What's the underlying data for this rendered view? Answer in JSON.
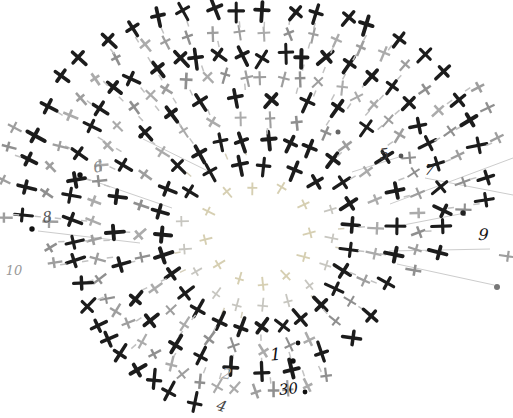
{
  "canvas": {
    "width": 513,
    "height": 418,
    "background": "#ffffff"
  },
  "diagram": {
    "kind": "crochet-single-crochet-chart",
    "center": {
      "x": 258,
      "y": 236
    },
    "radius_modulation": [
      1.0,
      1.1,
      0.98,
      1.12,
      1.02,
      0.98,
      0.97,
      0.98
    ],
    "colors": {
      "black_stitch": "#1c1c1c",
      "gray_stitch_shades": [
        "#8f8f8f",
        "#9e9e9e",
        "#ababab"
      ],
      "faint_tan": "#d6cfb2",
      "faint_gray": "#c7c6c0",
      "dash": "#c2c2c2",
      "dash_inner_tan": "#d5cfbb",
      "leader_line": "#cccccc"
    },
    "rounds": [
      {
        "name": "round-a",
        "r": 50,
        "spokes": 12,
        "offset": 95,
        "color": "tan",
        "arcs": [
          [
            0,
            360
          ]
        ]
      },
      {
        "name": "round-b",
        "r": 72,
        "spokes": 17,
        "offset": 20,
        "color": "mixed",
        "arcs": [
          [
            0,
            360
          ]
        ]
      },
      {
        "name": "round-c",
        "r": 94,
        "spokes": 27,
        "offset": 5,
        "color": "black",
        "arcs": [
          [
            0,
            360
          ]
        ]
      },
      {
        "name": "round-d",
        "r": 116,
        "spokes": 27,
        "offset": 5,
        "color": "gray",
        "arcs": [
          [
            0,
            360
          ]
        ]
      },
      {
        "name": "round-e",
        "r": 138,
        "spokes": 27,
        "offset": 5,
        "color": "black",
        "arcs": [
          [
            0,
            360
          ]
        ]
      },
      {
        "name": "round-f",
        "r": 160,
        "spokes": 54,
        "offset": 8.3,
        "color": "gray",
        "arcs": [
          [
            345,
            660
          ]
        ],
        "pairTilt": 0.35
      },
      {
        "name": "round-g",
        "r": 182,
        "spokes": 54,
        "offset": 8.3,
        "color": "black",
        "arcs": [
          [
            350,
            613
          ]
        ],
        "pairTilt": 0.25
      },
      {
        "name": "round-h",
        "r": 204,
        "spokes": 54,
        "offset": 8.3,
        "color": "gray",
        "arcs": [
          [
            2,
            194
          ]
        ]
      },
      {
        "name": "round-i",
        "r": 226,
        "spokes": 54,
        "offset": 8.3,
        "color": "black",
        "arcs": [
          [
            4,
            179
          ]
        ]
      },
      {
        "name": "round-j",
        "r": 248,
        "spokes": 54,
        "offset": 8.3,
        "color": "gray",
        "arcs": [
          [
            152,
            181
          ],
          [
            20,
            41
          ],
          [
            352,
            359
          ]
        ]
      }
    ],
    "labels": [
      {
        "text": "1",
        "x": 276,
        "y": 360,
        "size": 17,
        "color": "#111111",
        "rot": -4
      },
      {
        "text": "30",
        "x": 289,
        "y": 394,
        "size": 15,
        "color": "#111111",
        "rot": -6
      },
      {
        "text": "2",
        "x": 226,
        "y": 379,
        "size": 15,
        "color": "#a6a6a6",
        "rot": 8
      },
      {
        "text": "4",
        "x": 220,
        "y": 411,
        "size": 15,
        "color": "#4a4a4a",
        "rot": 18
      },
      {
        "text": "5",
        "x": 385,
        "y": 159,
        "size": 15,
        "color": "#3a3a3a",
        "rot": -8
      },
      {
        "text": "6",
        "x": 99,
        "y": 172,
        "size": 15,
        "color": "#8a8a8a",
        "rot": -10
      },
      {
        "text": "7",
        "x": 429,
        "y": 175,
        "size": 15,
        "color": "#222222",
        "rot": 6
      },
      {
        "text": "8",
        "x": 48,
        "y": 222,
        "size": 15,
        "color": "#5a5a5a",
        "rot": -8
      },
      {
        "text": "9",
        "x": 483,
        "y": 240,
        "size": 16,
        "color": "#161616",
        "rot": 4
      },
      {
        "text": "10",
        "x": 14,
        "y": 275,
        "size": 13,
        "color": "#9a9a9a",
        "rot": 0
      }
    ],
    "dots": [
      {
        "x": 298,
        "y": 343,
        "r": 2.4,
        "color": "#111111"
      },
      {
        "x": 293,
        "y": 361,
        "r": 2.7,
        "color": "#111111"
      },
      {
        "x": 305,
        "y": 392,
        "r": 2.4,
        "color": "#111111"
      },
      {
        "x": 141,
        "y": 136,
        "r": 2.4,
        "color": "#1a1a1a"
      },
      {
        "x": 80,
        "y": 175,
        "r": 2.7,
        "color": "#111111"
      },
      {
        "x": 32,
        "y": 229,
        "r": 2.7,
        "color": "#111111"
      },
      {
        "x": 463,
        "y": 213,
        "r": 2.7,
        "color": "#222222"
      },
      {
        "x": 401,
        "y": 156,
        "r": 2.4,
        "color": "#555555"
      },
      {
        "x": 497,
        "y": 287,
        "r": 3.0,
        "color": "#777777"
      },
      {
        "x": 338,
        "y": 132,
        "r": 2.5,
        "color": "#666666"
      }
    ],
    "leader_lines": [
      {
        "x1": 82,
        "y1": 177,
        "x2": 172,
        "y2": 208
      },
      {
        "x1": 143,
        "y1": 139,
        "x2": 212,
        "y2": 173
      },
      {
        "x1": 38,
        "y1": 231,
        "x2": 140,
        "y2": 243
      },
      {
        "x1": 352,
        "y1": 172,
        "x2": 399,
        "y2": 157
      },
      {
        "x1": 425,
        "y1": 178,
        "x2": 513,
        "y2": 195
      },
      {
        "x1": 390,
        "y1": 204,
        "x2": 513,
        "y2": 158
      },
      {
        "x1": 393,
        "y1": 227,
        "x2": 460,
        "y2": 214
      },
      {
        "x1": 389,
        "y1": 251,
        "x2": 490,
        "y2": 249
      },
      {
        "x1": 397,
        "y1": 264,
        "x2": 494,
        "y2": 285
      }
    ]
  }
}
